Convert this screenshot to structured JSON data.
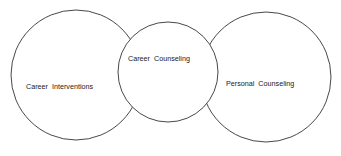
{
  "diagram": {
    "type": "venn-chain",
    "circles": [
      {
        "id": "career-interventions",
        "label": "Career Interventions",
        "cx": 76,
        "cy": 75,
        "r": 65
      },
      {
        "id": "personal-counseling",
        "label": "Personal Counseling",
        "cx": 266,
        "cy": 77,
        "r": 65
      },
      {
        "id": "career-counseling",
        "label": "Career Counseling",
        "cx": 168,
        "cy": 72,
        "r": 50
      }
    ],
    "colors": {
      "stroke": "#333333",
      "fill": "#ffffff",
      "text": "#1a1a1a"
    }
  }
}
